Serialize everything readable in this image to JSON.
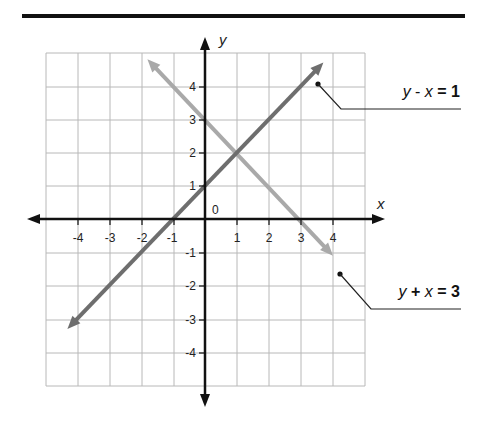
{
  "chart_data": {
    "type": "line",
    "title": "",
    "xlabel": "x",
    "ylabel": "y",
    "origin_label": "0",
    "xlim": [
      -5,
      5
    ],
    "ylim": [
      -5,
      5
    ],
    "grid": true,
    "x_ticks": [
      "-4",
      "-3",
      "-2",
      "-1",
      "1",
      "2",
      "3",
      "4"
    ],
    "y_ticks": [
      "4",
      "3",
      "2",
      "1",
      "-1",
      "-2",
      "-3",
      "-4"
    ],
    "series": [
      {
        "name": "y - x = 1",
        "label_var1": "y",
        "label_op": "-",
        "label_var2": "x",
        "label_eq": "= 1",
        "equation": "y = x + 1",
        "color": "#6e6e6e",
        "x": [
          -4.3,
          -1,
          0,
          1,
          3.7
        ],
        "y": [
          -3.3,
          0,
          1,
          2,
          4.7
        ]
      },
      {
        "name": "y + x = 3",
        "label_var1": "y",
        "label_op": "+",
        "label_var2": "x",
        "label_eq": "= 3",
        "equation": "y = -x + 3",
        "color": "#a9a9a9",
        "x": [
          -1.8,
          0,
          1,
          3,
          4
        ],
        "y": [
          4.8,
          3,
          2,
          0,
          -1.1
        ]
      }
    ],
    "intersection": {
      "x": 1,
      "y": 2
    }
  }
}
